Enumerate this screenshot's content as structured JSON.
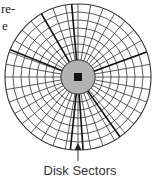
{
  "text_fragments": [
    "re-",
    "e"
  ],
  "diagram": {
    "title": "Disk Sectors",
    "label": "Disk Sectors",
    "center": [
      78,
      77
    ],
    "outer_radius": 73,
    "hub_radius": 17,
    "spindle_size": 8,
    "track_count": 7,
    "sector_count": 36,
    "colors": {
      "line": "#333333",
      "hub": "#b3b3b3",
      "spindle": "#111111",
      "background": "#ffffff"
    }
  }
}
